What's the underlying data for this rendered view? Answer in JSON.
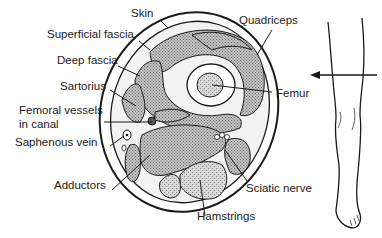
{
  "figure": {
    "colors": {
      "ink": "#1a1a1a",
      "muscle_fill": "#a8a8a8",
      "background": "#ffffff"
    }
  },
  "labels": {
    "skin": "Skin",
    "superficial_fascia": "Superficial fascia",
    "deep_fascia": "Deep fascia",
    "quadriceps": "Quadriceps",
    "sartorius": "Sartorius",
    "femur": "Femur",
    "femoral_vessels_line1": "Femoral vessels",
    "femoral_vessels_line2": "in canal",
    "saphenous_vein": "Saphenous vein",
    "adductors": "Adductors",
    "sciatic_nerve": "Sciatic nerve",
    "hamstrings": "Hamstrings"
  },
  "inset": {
    "description": "Leg outline with arrow indicating section level",
    "arrow_direction": "left"
  }
}
